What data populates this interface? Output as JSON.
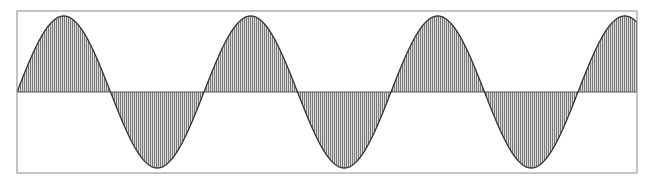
{
  "figure": {
    "type": "sine-wave-diagram",
    "frame": {
      "x": 17,
      "y": 11,
      "width": 620,
      "height": 162,
      "stroke": "#8a8a8a"
    },
    "axis": {
      "y": 92,
      "stroke": "#555555"
    },
    "wave": {
      "amplitude_px": 76,
      "period_px": 187,
      "start_x": 17,
      "end_x": 637,
      "phase": 0,
      "stroke": "#333333",
      "stroke_width": 1.3
    },
    "hatch": {
      "orientation": "vertical",
      "spacing_px": 2,
      "line_color": "#7a7a7a",
      "background": "#d9d9d9"
    },
    "cycles_visible": 3.3
  },
  "chart_data": {
    "type": "line",
    "title": "",
    "xlabel": "",
    "ylabel": "",
    "function": "sin",
    "x": [
      0,
      0.25,
      0.5,
      0.75,
      1.0,
      1.25,
      1.5,
      1.75,
      2.0,
      2.25,
      2.5,
      2.75,
      3.0,
      3.25,
      3.32
    ],
    "values": [
      0,
      1,
      0,
      -1,
      0,
      1,
      0,
      -1,
      0,
      1,
      0,
      -1,
      0,
      1,
      0.93
    ],
    "x_unit": "cycles",
    "ylim": [
      -1.07,
      1.07
    ],
    "grid": false,
    "fill": "hatched between curve and zero line"
  }
}
